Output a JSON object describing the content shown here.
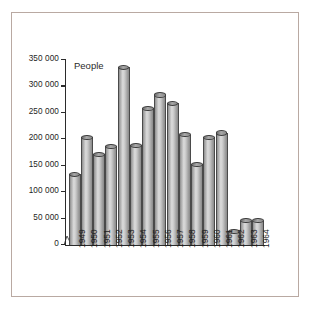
{
  "chart_data": {
    "type": "bar",
    "title": "",
    "subtitle": "",
    "ylabel": "People",
    "xlabel": "",
    "categories": [
      "1949",
      "1950",
      "1951",
      "1952",
      "1953",
      "1954",
      "1955",
      "1956",
      "1957",
      "1958",
      "1959",
      "1960",
      "1961",
      "1962",
      "1963",
      "1964"
    ],
    "values": [
      133000,
      203000,
      171000,
      186000,
      335000,
      188000,
      258000,
      283000,
      267000,
      208000,
      152000,
      203000,
      211000,
      25000,
      45000,
      45000
    ],
    "ylim": [
      0,
      350000
    ],
    "ytick_labels": [
      "0",
      "50 000",
      "100 000",
      "150 000",
      "200 000",
      "250 000",
      "300 000",
      "350 000"
    ],
    "ytick_values": [
      0,
      50000,
      100000,
      150000,
      200000,
      250000,
      300000,
      350000
    ],
    "grid": false,
    "legend": "none",
    "bar_style": "cylinder-3d",
    "colors": {
      "bar_fill_light": "#dcdcdc",
      "bar_fill_mid": "#b5b5b5",
      "bar_fill_dark": "#8a8a8a",
      "bar_outline": "#4a4a4a",
      "axis": "#2b2b2b",
      "text": "#1d1d1d",
      "frame_border": "#b9a9a2",
      "background": "#ffffff"
    }
  }
}
